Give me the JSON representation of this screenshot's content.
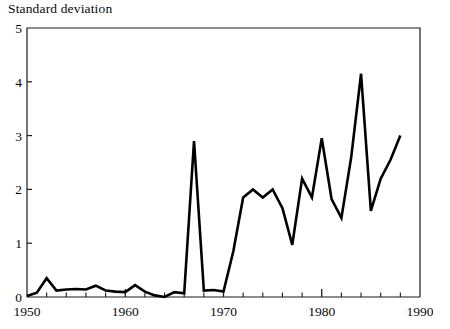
{
  "chart_data": {
    "type": "line",
    "title": "Standard deviation",
    "xlabel": "",
    "ylabel": "Standard deviation",
    "xlim": [
      1950,
      1990
    ],
    "ylim": [
      0,
      5
    ],
    "grid": false,
    "legend": "none",
    "yticks": [
      0,
      1,
      2,
      3,
      4,
      5
    ],
    "ytick_labels": [
      "0",
      "1",
      "2",
      "3",
      "4",
      "5"
    ],
    "xticks": [
      1950,
      1960,
      1970,
      1980,
      1990
    ],
    "xtick_labels": [
      "1950",
      "1960",
      "1970",
      "1980",
      "1990"
    ],
    "x_minor_tick_interval": 2,
    "line_color": "#000000",
    "line_width": 2.6,
    "series": [
      {
        "name": "Standard deviation",
        "x": [
          1950,
          1951,
          1952,
          1953,
          1954,
          1955,
          1956,
          1957,
          1958,
          1959,
          1960,
          1961,
          1962,
          1963,
          1964,
          1965,
          1966,
          1967,
          1968,
          1969,
          1970,
          1971,
          1972,
          1973,
          1974,
          1975,
          1976,
          1977,
          1978,
          1979,
          1980,
          1981,
          1982,
          1983,
          1984,
          1985,
          1986,
          1987,
          1988
        ],
        "values": [
          0.02,
          0.08,
          0.35,
          0.12,
          0.14,
          0.15,
          0.14,
          0.21,
          0.12,
          0.1,
          0.09,
          0.22,
          0.1,
          0.03,
          0.0,
          0.09,
          0.07,
          2.9,
          0.12,
          0.13,
          0.1,
          0.85,
          1.85,
          2.0,
          1.85,
          2.0,
          1.65,
          0.97,
          2.2,
          1.85,
          2.95,
          1.82,
          1.47,
          2.6,
          4.15,
          1.6,
          2.2,
          2.55,
          3.0
        ]
      }
    ]
  }
}
